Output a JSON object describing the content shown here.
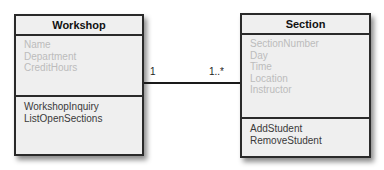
{
  "diagram": {
    "type": "UML class diagram",
    "classes": [
      {
        "name": "Workshop",
        "attributes": [
          "Name",
          "Department",
          "CreditHours"
        ],
        "methods": [
          "WorkshopInquiry",
          "ListOpenSections"
        ]
      },
      {
        "name": "Section",
        "attributes": [
          "SectionNumber",
          "Day",
          "Time",
          "Location",
          "Instructor"
        ],
        "methods": [
          "AddStudent",
          "RemoveStudent"
        ]
      }
    ],
    "association": {
      "from": "Workshop",
      "to": "Section",
      "from_multiplicity": "1",
      "to_multiplicity": "1..*"
    }
  },
  "colors": {
    "box_fill": "#efefef",
    "border": "#2a2a2a",
    "attribute_text": "#bcbcbc",
    "method_text": "#3a3a3a"
  }
}
